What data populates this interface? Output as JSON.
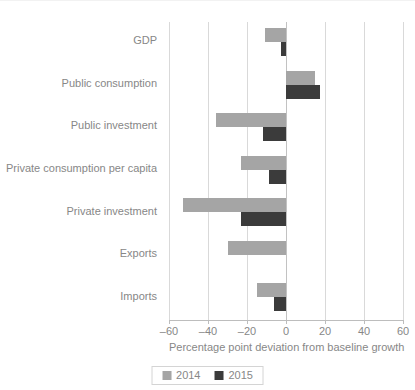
{
  "chart_data": {
    "type": "bar",
    "orientation": "horizontal",
    "title": "",
    "xlabel": "Percentage point deviation from baseline growth",
    "ylabel": "",
    "xlim": [
      -60,
      60
    ],
    "xticks": [
      -60,
      -40,
      -20,
      0,
      20,
      40,
      60
    ],
    "xticklabels": [
      "–60",
      "–40",
      "–20",
      "0",
      "20",
      "40",
      "60"
    ],
    "grid": true,
    "grid_axis": "x",
    "legend_position": "bottom",
    "categories": [
      "GDP",
      "Public consumption",
      "Public investment",
      "Private consumption per capita",
      "Private investment",
      "Exports",
      "Imports"
    ],
    "series": [
      {
        "name": "2014",
        "color": "#a5a5a5",
        "values": [
          -11,
          15,
          -36,
          -23,
          -53,
          -30,
          -15
        ]
      },
      {
        "name": "2015",
        "color": "#3b3b3b",
        "values": [
          -2.5,
          17.5,
          -12,
          -8.5,
          -23,
          0,
          -6
        ]
      }
    ]
  },
  "legend": {
    "entries": [
      {
        "label": "2014",
        "color": "#a5a5a5"
      },
      {
        "label": "2015",
        "color": "#3b3b3b"
      }
    ]
  },
  "colors": {
    "series_2014": "#a5a5a5",
    "series_2015": "#3b3b3b",
    "gridline": "#d9d9d9",
    "axis": "#bdbdbd",
    "text": "#878787"
  }
}
